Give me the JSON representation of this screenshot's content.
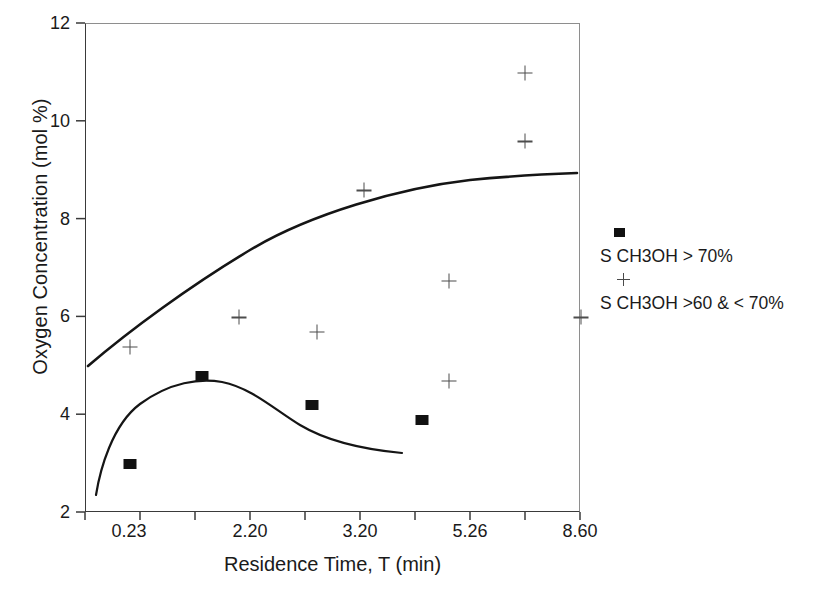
{
  "chart_data": {
    "type": "scatter",
    "title": "",
    "xlabel": "Residence Time, T (min)",
    "ylabel": "Oxygen Concentration (mol %)",
    "x_tick_labels": [
      "0.23",
      "2.20",
      "3.20",
      "5.26",
      "8.60"
    ],
    "x_tick_positions": [
      0.23,
      2.2,
      3.2,
      5.26,
      8.6
    ],
    "y_tick_labels": [
      "2",
      "4",
      "6",
      "8",
      "10",
      "12"
    ],
    "ylim": [
      2,
      12
    ],
    "grid": false,
    "legend_position": "right",
    "series": [
      {
        "name": "S CH3OH > 70%",
        "marker": "filled-square",
        "color": "#111111",
        "points": [
          {
            "x": 0.23,
            "y": 3.0
          },
          {
            "x": 1.4,
            "y": 4.8
          },
          {
            "x": 2.75,
            "y": 4.2
          },
          {
            "x": 4.35,
            "y": 3.9
          }
        ]
      },
      {
        "name": "S CH3OH >60 & < 70%",
        "marker": "plus",
        "color": "#4d4d4d",
        "points": [
          {
            "x": 0.23,
            "y": 5.4
          },
          {
            "x": 2.0,
            "y": 6.0
          },
          {
            "x": 2.8,
            "y": 5.7
          },
          {
            "x": 3.25,
            "y": 8.6
          },
          {
            "x": 4.85,
            "y": 6.75
          },
          {
            "x": 4.85,
            "y": 4.7
          },
          {
            "x": 6.9,
            "y": 11.0
          },
          {
            "x": 6.9,
            "y": 9.6
          },
          {
            "x": 8.6,
            "y": 6.0
          }
        ]
      }
    ],
    "trend_curves": [
      {
        "name": "upper-trend-curve",
        "for_series": "S CH3OH >60 & < 70%",
        "description": "rising concave-down curve from about 5.0 to 8.95 mol %",
        "start": {
          "y": 5.0
        },
        "end": {
          "y": 8.95
        }
      },
      {
        "name": "lower-trend-curve",
        "for_series": "S CH3OH > 70%",
        "description": "curve rising to a maximum near 4.9 mol % then falling to about 3.6 mol %",
        "start": {
          "y": 2.72
        },
        "peak": {
          "y": 4.9
        },
        "end": {
          "y": 3.6
        }
      }
    ]
  },
  "legend": {
    "entries": [
      {
        "label": "S CH3OH > 70%",
        "marker": "filled-square"
      },
      {
        "label": "S CH3OH >60 & < 70%",
        "marker": "plus"
      }
    ]
  },
  "caption_remnant": ""
}
